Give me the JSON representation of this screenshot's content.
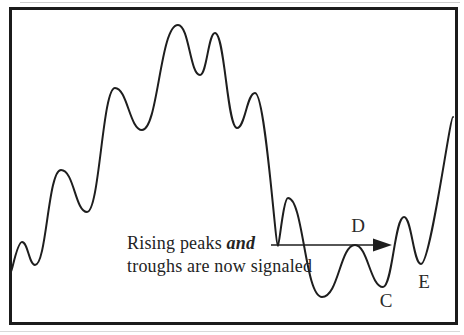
{
  "figure": {
    "background_color": "#ffffff",
    "frame_color": "#1b1b1b"
  },
  "chart_data": {
    "type": "line",
    "title": "",
    "xlabel": "",
    "ylabel": "",
    "axes": "none",
    "grid": false,
    "legend": null,
    "stroke_color": "#1e1e1e",
    "stroke_width": 2,
    "points": [
      {
        "x": 11,
        "y": 272,
        "ke": 0.08
      },
      {
        "x": 22,
        "y": 242
      },
      {
        "x": 35,
        "y": 265
      },
      {
        "x": 61,
        "y": 170,
        "ks": 0.5,
        "ke": 0.5
      },
      {
        "x": 87,
        "y": 212
      },
      {
        "x": 115,
        "y": 88
      },
      {
        "x": 142,
        "y": 130
      },
      {
        "x": 178,
        "y": 25,
        "ks": 0.5,
        "ke": 0.5
      },
      {
        "x": 200,
        "y": 75
      },
      {
        "x": 215,
        "y": 33
      },
      {
        "x": 237,
        "y": 128
      },
      {
        "x": 255,
        "y": 93
      },
      {
        "x": 278,
        "y": 246,
        "ks": 0.12,
        "ke": 0.12
      },
      {
        "x": 288,
        "y": 198
      },
      {
        "x": 322,
        "y": 297,
        "ks": 0.5,
        "ke": 0.5
      },
      {
        "x": 355,
        "y": 245
      },
      {
        "x": 383,
        "y": 287
      },
      {
        "x": 404,
        "y": 217
      },
      {
        "x": 421,
        "y": 264,
        "ke": 0.3
      },
      {
        "x": 453,
        "y": 117,
        "ks": 0.1
      }
    ],
    "annotation": {
      "line1_prefix": "Rising peaks ",
      "line1_emphasis": "and",
      "line2": "troughs are now signaled",
      "arrow": {
        "x1": 271,
        "y1": 245,
        "x2": 392,
        "y2": 245,
        "head_length": 19,
        "head_width": 13
      }
    },
    "point_labels": [
      {
        "text": "D",
        "x": 358,
        "y": 227
      },
      {
        "text": "C",
        "x": 386,
        "y": 302
      },
      {
        "text": "E",
        "x": 424,
        "y": 283
      }
    ]
  }
}
